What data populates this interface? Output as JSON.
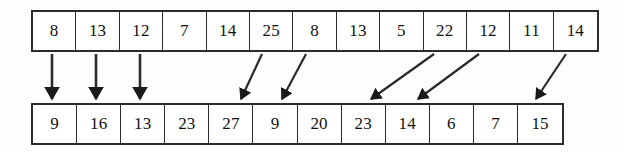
{
  "diagram": {
    "type": "array-mapping-diagram",
    "background_color": "#fdfdfd",
    "line_color": "#2b2b2b",
    "top_array": {
      "name": "top-array",
      "cell_count": 13,
      "values": [
        "8",
        "13",
        "12",
        "7",
        "14",
        "25",
        "8",
        "13",
        "5",
        "22",
        "12",
        "11",
        "14"
      ]
    },
    "bottom_array": {
      "name": "bottom-array",
      "cell_count": 12,
      "values": [
        "9",
        "16",
        "13",
        "23",
        "27",
        "9",
        "20",
        "23",
        "14",
        "6",
        "7",
        "15"
      ]
    },
    "arrows": [
      {
        "name": "arrow-vertical-1",
        "from_index": 0,
        "to_index": 0,
        "x1": 52,
        "y1": 54,
        "x2": 52,
        "y2": 99,
        "style": "vertical"
      },
      {
        "name": "arrow-vertical-2",
        "from_index": 1,
        "to_index": 1,
        "x1": 96,
        "y1": 54,
        "x2": 96,
        "y2": 99,
        "style": "vertical"
      },
      {
        "name": "arrow-vertical-3",
        "from_index": 2,
        "to_index": 2,
        "x1": 140,
        "y1": 54,
        "x2": 140,
        "y2": 99,
        "style": "vertical"
      },
      {
        "name": "arrow-diagonal-1",
        "from_index": 5,
        "to_index": 4,
        "x1": 262,
        "y1": 54,
        "x2": 241,
        "y2": 99,
        "style": "diagonal"
      },
      {
        "name": "arrow-diagonal-2",
        "from_index": 6,
        "to_index": 5,
        "x1": 306,
        "y1": 54,
        "x2": 282,
        "y2": 99,
        "style": "diagonal"
      },
      {
        "name": "arrow-diagonal-3",
        "from_index": 9,
        "to_index": 7,
        "x1": 434,
        "y1": 54,
        "x2": 371,
        "y2": 99,
        "style": "diagonal"
      },
      {
        "name": "arrow-diagonal-4",
        "from_index": 10,
        "to_index": 8,
        "x1": 479,
        "y1": 54,
        "x2": 418,
        "y2": 99,
        "style": "diagonal"
      },
      {
        "name": "arrow-diagonal-5",
        "from_index": 12,
        "to_index": 11,
        "x1": 566,
        "y1": 54,
        "x2": 536,
        "y2": 99,
        "style": "diagonal"
      }
    ]
  }
}
